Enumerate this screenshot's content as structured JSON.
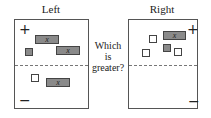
{
  "titles": {
    "left": "Left",
    "right": "Right"
  },
  "question": {
    "line1": "Which",
    "line2": "is",
    "line3": "greater?"
  },
  "signs": {
    "positive": "+",
    "negative": "−"
  },
  "variable_label": "x",
  "colors": {
    "negative_tile": "#8a8a8a",
    "positive_tile": "#ffffff",
    "border": "#444444"
  },
  "left_panel": {
    "positive_region": {
      "x_bars": 2,
      "negative_unit_squares": 1
    },
    "negative_region": {
      "x_bars": 1,
      "positive_unit_squares": 1
    }
  },
  "right_panel": {
    "positive_region": {
      "x_bars": 1,
      "positive_unit_squares": 3,
      "negative_unit_squares": 1
    },
    "negative_region": {
      "x_bars": 0,
      "unit_squares": 0
    }
  }
}
